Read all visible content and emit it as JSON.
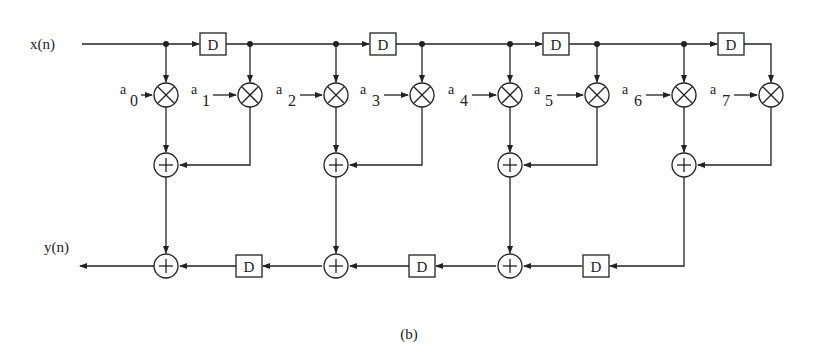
{
  "diagram": {
    "input_label": "x(n)",
    "output_label": "y(n)",
    "delay_label": "D",
    "caption": "(b)",
    "coefficients": [
      {
        "base": "a",
        "sub": "0"
      },
      {
        "base": "a",
        "sub": "1"
      },
      {
        "base": "a",
        "sub": "2"
      },
      {
        "base": "a",
        "sub": "3"
      },
      {
        "base": "a",
        "sub": "4"
      },
      {
        "base": "a",
        "sub": "5"
      },
      {
        "base": "a",
        "sub": "6"
      },
      {
        "base": "a",
        "sub": "7"
      }
    ],
    "multiplier_symbol": "×",
    "adder_symbol": "+",
    "colors": {
      "ink": "#222222",
      "background": "#ffffff"
    }
  }
}
